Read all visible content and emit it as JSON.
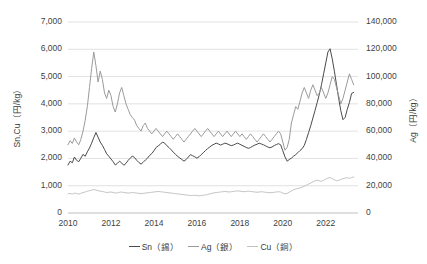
{
  "axes": {
    "y_left_title": "Sn,Cu（円/kg）",
    "y_right_title": "Ag（円/kg）",
    "y_left_ticks": [
      "0",
      "1,000",
      "2,000",
      "3,000",
      "4,000",
      "5,000",
      "6,000",
      "7,000"
    ],
    "y_right_ticks": [
      "0",
      "20,000",
      "40,000",
      "60,000",
      "80,000",
      "100,000",
      "120,000",
      "140,000"
    ],
    "x_ticks": [
      "2010",
      "2012",
      "2014",
      "2016",
      "2018",
      "2020",
      "2022"
    ]
  },
  "legend": {
    "items": [
      {
        "label": "Sn（錫）",
        "color": "#4a4a4a"
      },
      {
        "label": "Ag（銀）",
        "color": "#9a9a9a"
      },
      {
        "label": "Cu（銅）",
        "color": "#c2c2c2"
      }
    ]
  },
  "colors": {
    "sn": "#4a4a4a",
    "ag": "#9b9b9b",
    "cu": "#c4c4c4",
    "grid": "#d9d9d9",
    "axis": "#bfbfbf",
    "text": "#3f3f3f",
    "background": "#ffffff"
  },
  "chart_data": {
    "type": "line",
    "title": "",
    "xlabel": "",
    "ylabel": "Sn,Cu（円/kg）",
    "ylabel_right": "Ag（円/kg）",
    "xlim": [
      2010.0,
      2023.5
    ],
    "ylim": [
      0,
      7000
    ],
    "ylim_right": [
      0,
      140000
    ],
    "grid": true,
    "legend_position": "bottom",
    "x": [
      2010.0,
      2010.1,
      2010.2,
      2010.3,
      2010.4,
      2010.5,
      2010.6,
      2010.7,
      2010.8,
      2010.9,
      2011.0,
      2011.1,
      2011.2,
      2011.3,
      2011.4,
      2011.5,
      2011.6,
      2011.7,
      2011.8,
      2011.9,
      2012.0,
      2012.1,
      2012.2,
      2012.3,
      2012.4,
      2012.5,
      2012.6,
      2012.7,
      2012.8,
      2012.9,
      2013.0,
      2013.1,
      2013.2,
      2013.3,
      2013.4,
      2013.5,
      2013.6,
      2013.7,
      2013.8,
      2013.9,
      2014.0,
      2014.1,
      2014.2,
      2014.3,
      2014.4,
      2014.5,
      2014.6,
      2014.7,
      2014.8,
      2014.9,
      2015.0,
      2015.1,
      2015.2,
      2015.3,
      2015.4,
      2015.5,
      2015.6,
      2015.7,
      2015.8,
      2015.9,
      2016.0,
      2016.1,
      2016.2,
      2016.3,
      2016.4,
      2016.5,
      2016.6,
      2016.7,
      2016.8,
      2016.9,
      2017.0,
      2017.1,
      2017.2,
      2017.3,
      2017.4,
      2017.5,
      2017.6,
      2017.7,
      2017.8,
      2017.9,
      2018.0,
      2018.1,
      2018.2,
      2018.3,
      2018.4,
      2018.5,
      2018.6,
      2018.7,
      2018.8,
      2018.9,
      2019.0,
      2019.1,
      2019.2,
      2019.3,
      2019.4,
      2019.5,
      2019.6,
      2019.7,
      2019.8,
      2019.9,
      2020.0,
      2020.1,
      2020.2,
      2020.3,
      2020.4,
      2020.5,
      2020.6,
      2020.7,
      2020.8,
      2020.9,
      2021.0,
      2021.1,
      2021.2,
      2021.3,
      2021.4,
      2021.5,
      2021.6,
      2021.7,
      2021.8,
      2021.9,
      2022.0,
      2022.1,
      2022.2,
      2022.3,
      2022.4,
      2022.5,
      2022.6,
      2022.7,
      2022.8,
      2022.9,
      2023.0,
      2023.1,
      2023.2,
      2023.3
    ],
    "series": [
      {
        "name": "Sn（錫）",
        "axis": "left",
        "unit": "円/kg",
        "color": "#4a4a4a",
        "values": [
          1760,
          1900,
          1840,
          2050,
          1930,
          1880,
          2010,
          2150,
          2080,
          2240,
          2380,
          2560,
          2760,
          2950,
          2780,
          2600,
          2480,
          2330,
          2170,
          2080,
          1980,
          1880,
          1760,
          1820,
          1900,
          1830,
          1750,
          1820,
          1930,
          2010,
          2090,
          2030,
          1930,
          1850,
          1790,
          1860,
          1940,
          2010,
          2110,
          2180,
          2280,
          2400,
          2460,
          2520,
          2600,
          2560,
          2470,
          2400,
          2320,
          2230,
          2150,
          2080,
          2020,
          1960,
          1900,
          1960,
          2050,
          2140,
          2100,
          2060,
          2010,
          2060,
          2140,
          2210,
          2290,
          2360,
          2420,
          2480,
          2520,
          2560,
          2530,
          2490,
          2520,
          2560,
          2540,
          2500,
          2470,
          2490,
          2530,
          2560,
          2520,
          2480,
          2440,
          2400,
          2370,
          2400,
          2450,
          2490,
          2520,
          2560,
          2530,
          2500,
          2460,
          2420,
          2390,
          2420,
          2470,
          2510,
          2540,
          2500,
          2280,
          2060,
          1900,
          1960,
          2010,
          2080,
          2140,
          2210,
          2290,
          2360,
          2480,
          2700,
          2950,
          3200,
          3480,
          3760,
          4050,
          4350,
          4700,
          5100,
          5500,
          5900,
          6020,
          5650,
          5200,
          4700,
          4200,
          3750,
          3420,
          3500,
          3800,
          4050,
          4380,
          4420
        ]
      },
      {
        "name": "Ag（銀）",
        "axis": "right",
        "unit": "円/kg",
        "color": "#9b9b9b",
        "values": [
          50000,
          53000,
          51000,
          55000,
          52000,
          50000,
          54000,
          60000,
          68000,
          78000,
          92000,
          106000,
          118000,
          108000,
          96000,
          104000,
          98000,
          88000,
          84000,
          90000,
          86000,
          78000,
          74000,
          80000,
          88000,
          92000,
          86000,
          80000,
          76000,
          72000,
          70000,
          68000,
          64000,
          62000,
          60000,
          64000,
          66000,
          62000,
          60000,
          58000,
          60000,
          62000,
          60000,
          58000,
          56000,
          58000,
          60000,
          58000,
          56000,
          54000,
          56000,
          58000,
          56000,
          54000,
          52000,
          54000,
          56000,
          58000,
          60000,
          62000,
          60000,
          58000,
          56000,
          58000,
          60000,
          62000,
          60000,
          58000,
          56000,
          58000,
          60000,
          58000,
          56000,
          58000,
          60000,
          58000,
          56000,
          58000,
          60000,
          58000,
          56000,
          58000,
          56000,
          54000,
          56000,
          58000,
          56000,
          54000,
          52000,
          54000,
          56000,
          58000,
          56000,
          54000,
          52000,
          54000,
          56000,
          58000,
          60000,
          58000,
          52000,
          46000,
          48000,
          54000,
          66000,
          72000,
          78000,
          76000,
          82000,
          88000,
          92000,
          88000,
          84000,
          90000,
          94000,
          90000,
          86000,
          88000,
          92000,
          88000,
          84000,
          88000,
          94000,
          100000,
          98000,
          92000,
          86000,
          80000,
          84000,
          90000,
          96000,
          102000,
          98000,
          94000
        ]
      },
      {
        "name": "Cu（銅）",
        "axis": "left",
        "unit": "円/kg",
        "color": "#c4c4c4",
        "values": [
          700,
          720,
          690,
          730,
          710,
          690,
          720,
          750,
          770,
          800,
          820,
          840,
          860,
          840,
          820,
          800,
          790,
          770,
          750,
          760,
          770,
          750,
          730,
          740,
          760,
          770,
          750,
          740,
          730,
          740,
          750,
          740,
          730,
          720,
          710,
          720,
          730,
          740,
          750,
          760,
          770,
          780,
          790,
          780,
          770,
          760,
          750,
          740,
          730,
          720,
          710,
          700,
          690,
          680,
          670,
          660,
          650,
          640,
          640,
          650,
          640,
          630,
          640,
          650,
          660,
          680,
          700,
          720,
          740,
          750,
          760,
          770,
          780,
          790,
          780,
          770,
          780,
          790,
          800,
          810,
          800,
          790,
          780,
          790,
          800,
          790,
          780,
          770,
          760,
          770,
          780,
          770,
          760,
          750,
          740,
          750,
          760,
          770,
          780,
          770,
          730,
          700,
          720,
          760,
          810,
          850,
          880,
          900,
          920,
          950,
          980,
          1020,
          1060,
          1100,
          1140,
          1180,
          1200,
          1180,
          1160,
          1200,
          1240,
          1280,
          1300,
          1260,
          1220,
          1180,
          1200,
          1230,
          1260,
          1280,
          1290,
          1270,
          1300,
          1320
        ]
      }
    ]
  }
}
